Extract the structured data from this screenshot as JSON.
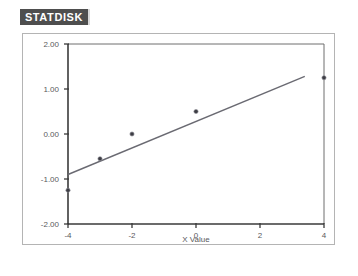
{
  "badge": {
    "label": "STATDISK"
  },
  "chart_data": {
    "type": "scatter",
    "title": "",
    "subtitle": "",
    "xlabel": "X Value",
    "ylabel": "",
    "xlim": [
      -4,
      4
    ],
    "ylim": [
      -2.0,
      2.0
    ],
    "xticks": [
      -4,
      -2,
      0,
      2,
      4
    ],
    "xtick_labels": [
      "-4",
      "-2",
      "0",
      "2",
      "4"
    ],
    "yticks": [
      2.0,
      1.0,
      0.0,
      -1.0,
      -2.0
    ],
    "ytick_labels": [
      "2.00",
      "1.00",
      "0.00",
      "-1.00",
      "-2.00"
    ],
    "grid": false,
    "legend": null,
    "series": [
      {
        "name": "Data Points",
        "marker": "circle",
        "color": "#3d3d44",
        "points": [
          {
            "x": -4.0,
            "y": -1.25
          },
          {
            "x": -3.0,
            "y": -0.55
          },
          {
            "x": -2.0,
            "y": 0.0
          },
          {
            "x": 0.0,
            "y": 0.5
          },
          {
            "x": 4.0,
            "y": 1.25
          }
        ]
      },
      {
        "name": "Regression Line",
        "type": "line",
        "color": "#6a6a72",
        "points": [
          {
            "x": -4.0,
            "y": -0.9
          },
          {
            "x": 3.4,
            "y": 1.28
          }
        ]
      }
    ]
  }
}
